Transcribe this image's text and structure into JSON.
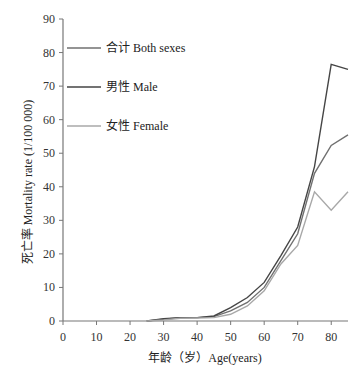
{
  "chart_data": {
    "type": "line",
    "title": "",
    "xlabel": "年龄（岁）Age(years)",
    "ylabel": "死亡率 Mortality rate (1/100 000)",
    "xlim": [
      0,
      85
    ],
    "ylim": [
      0,
      90
    ],
    "x_ticks": [
      0,
      10,
      20,
      30,
      40,
      50,
      60,
      70,
      80
    ],
    "y_ticks": [
      0,
      10,
      20,
      30,
      40,
      50,
      60,
      70,
      80,
      90
    ],
    "grid": false,
    "legend_position": "upper-left, inside",
    "x": [
      25,
      30,
      35,
      40,
      45,
      50,
      55,
      60,
      65,
      70,
      75,
      80,
      85
    ],
    "series": [
      {
        "name": "合计 Both sexes",
        "color": "#707070",
        "values": [
          0,
          0.5,
          1,
          1,
          1.3,
          3,
          5.5,
          10,
          18,
          26,
          44,
          52.3,
          55.5
        ]
      },
      {
        "name": "男性 Male",
        "color": "#454545",
        "values": [
          0,
          0.7,
          1,
          1,
          1.5,
          4,
          7,
          11.5,
          19.5,
          28,
          46,
          76.5,
          75
        ]
      },
      {
        "name": "女性 Female",
        "color": "#a8a8a8",
        "values": [
          0,
          0.3,
          0.8,
          0.9,
          1,
          2,
          4.5,
          9,
          17,
          22.5,
          38.5,
          33,
          38.5
        ]
      }
    ]
  },
  "legend": [
    {
      "label": "合计 Both sexes",
      "color": "#707070"
    },
    {
      "label": "男性 Male",
      "color": "#454545"
    },
    {
      "label": "女性 Female",
      "color": "#a8a8a8"
    }
  ],
  "axes": {
    "xlabel": "年龄（岁）Age(years)",
    "ylabel": "死亡率 Mortality rate (1/100 000)"
  }
}
